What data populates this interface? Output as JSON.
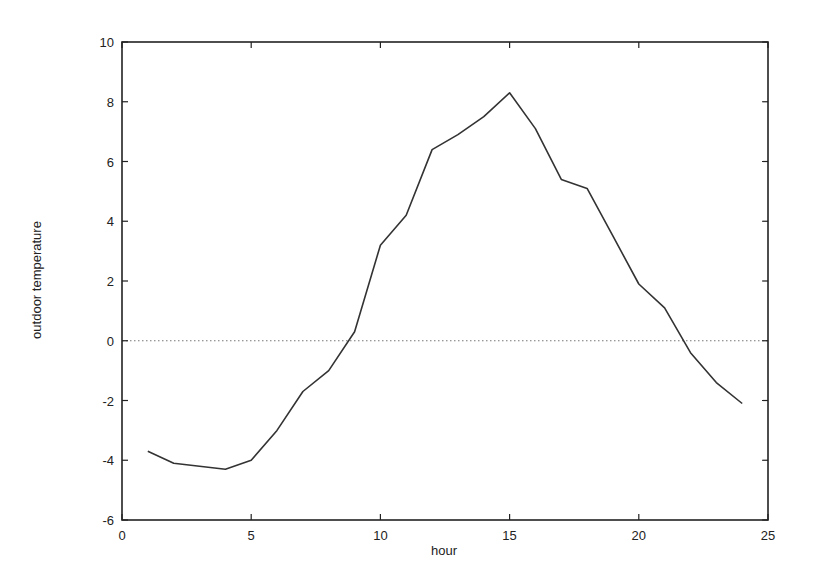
{
  "chart_data": {
    "type": "line",
    "title": "",
    "xlabel": "hour",
    "ylabel": "outdoor temperature",
    "xlim": [
      0,
      25
    ],
    "ylim": [
      -6,
      10
    ],
    "xticks": [
      0,
      5,
      10,
      15,
      20,
      25
    ],
    "yticks": [
      -6,
      -4,
      -2,
      0,
      2,
      4,
      6,
      8,
      10
    ],
    "grid": false,
    "zero_line": {
      "y": 0,
      "style": "dotted"
    },
    "legend": null,
    "series": [
      {
        "name": "outdoor temperature",
        "x": [
          1,
          2,
          3,
          4,
          5,
          6,
          7,
          8,
          9,
          10,
          11,
          12,
          13,
          14,
          15,
          16,
          17,
          18,
          19,
          20,
          21,
          22,
          23,
          24
        ],
        "values": [
          -3.7,
          -4.1,
          -4.2,
          -4.3,
          -4.0,
          -3.0,
          -1.7,
          -1.0,
          0.3,
          3.2,
          4.2,
          6.4,
          6.9,
          7.5,
          8.3,
          7.1,
          5.4,
          5.1,
          3.5,
          1.9,
          1.1,
          -0.4,
          -1.4,
          -2.1
        ],
        "color": "#333333"
      }
    ]
  }
}
